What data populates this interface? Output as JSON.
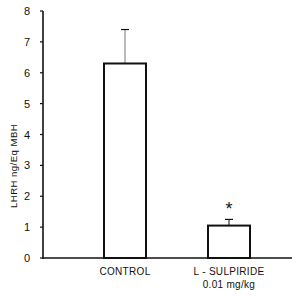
{
  "chart_data": {
    "type": "bar",
    "title": "",
    "xlabel": "",
    "ylabel": "LHRH  ng/Eq  MBH",
    "ylim": [
      0,
      8
    ],
    "yticks": [
      0,
      1,
      2,
      3,
      4,
      5,
      6,
      7,
      8
    ],
    "grid": false,
    "legend": null,
    "categories": [
      "CONTROL",
      "L-SULPIRIDE 0.01 mg/kg"
    ],
    "category_lines": [
      [
        "CONTROL"
      ],
      [
        "L - SULPIRIDE",
        "0.01  mg/kg"
      ]
    ],
    "values": [
      6.3,
      1.05
    ],
    "error_upper": [
      1.1,
      0.2
    ],
    "annotations": [
      {
        "category": "L-SULPIRIDE 0.01 mg/kg",
        "text": "*",
        "meaning": "significance marker"
      }
    ],
    "colors": {
      "bar_fill": "#ffffff",
      "bar_edge": "#111111",
      "axis": "#111111"
    }
  }
}
